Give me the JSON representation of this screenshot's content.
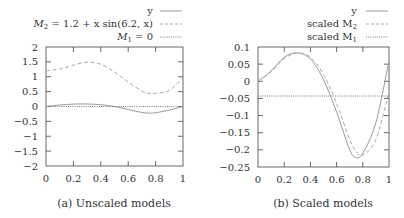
{
  "chart_data": [
    {
      "type": "line",
      "caption": "(a) Unscaled models",
      "xlabel": "",
      "ylabel": "",
      "xlim": [
        0,
        1
      ],
      "ylim": [
        -2,
        2
      ],
      "xticks": [
        "0",
        "0.2",
        "0.4",
        "0.6",
        "0.8",
        "1"
      ],
      "yticks": [
        "2",
        "1.5",
        "1",
        "0.5",
        "0",
        "−0.5",
        "−1",
        "−1.5",
        "−2"
      ],
      "grid": false,
      "legend_position": "top-right, above plot",
      "x": [
        0,
        0.1,
        0.2,
        0.3,
        0.4,
        0.5,
        0.6,
        0.7,
        0.75,
        0.8,
        0.9,
        1.0
      ],
      "series": [
        {
          "name": "y",
          "style": "solid",
          "color": "#999999",
          "values": [
            0,
            0.05,
            0.08,
            0.085,
            0.06,
            0.0,
            -0.1,
            -0.2,
            -0.22,
            -0.21,
            -0.12,
            0.0
          ]
        },
        {
          "name": "M_2 = 1.2 + x sin(6.2, x)",
          "style": "dashed",
          "color": "#aaaaaa",
          "values": [
            1.2,
            1.26,
            1.39,
            1.49,
            1.42,
            1.16,
            0.82,
            0.52,
            0.44,
            0.44,
            0.54,
            0.97
          ]
        },
        {
          "name": "M_1 = 0",
          "style": "dotted",
          "color": "#777777",
          "values": [
            0,
            0,
            0,
            0,
            0,
            0,
            0,
            0,
            0,
            0,
            0,
            0
          ]
        }
      ]
    },
    {
      "type": "line",
      "caption": "(b) Scaled models",
      "xlabel": "",
      "ylabel": "",
      "xlim": [
        0,
        1
      ],
      "ylim": [
        -0.25,
        0.1
      ],
      "xticks": [
        "0",
        "0.2",
        "0.4",
        "0.6",
        "0.8",
        "1"
      ],
      "yticks": [
        "0.1",
        "0.05",
        "0",
        "−0.05",
        "−0.1",
        "−0.15",
        "−0.2",
        "−0.25"
      ],
      "grid": false,
      "legend_position": "top-right, above plot",
      "x": [
        0,
        0.1,
        0.2,
        0.3,
        0.4,
        0.5,
        0.6,
        0.7,
        0.75,
        0.8,
        0.9,
        1.0
      ],
      "series": [
        {
          "name": "y",
          "style": "solid",
          "color": "#999999",
          "values": [
            0.0,
            0.03,
            0.07,
            0.083,
            0.065,
            0.005,
            -0.09,
            -0.2,
            -0.222,
            -0.21,
            -0.12,
            0.06
          ]
        },
        {
          "name": "scaled M_2",
          "style": "dashed",
          "color": "#aaaaaa",
          "values": [
            0.0,
            0.028,
            0.066,
            0.082,
            0.07,
            0.02,
            -0.065,
            -0.17,
            -0.205,
            -0.215,
            -0.17,
            -0.03
          ]
        },
        {
          "name": "scaled M_1",
          "style": "dotted",
          "color": "#777777",
          "values": [
            -0.043,
            -0.043,
            -0.043,
            -0.043,
            -0.043,
            -0.043,
            -0.043,
            -0.043,
            -0.043,
            -0.043,
            -0.043,
            -0.043
          ]
        }
      ]
    }
  ],
  "legend_a": {
    "y": "y",
    "m2_prefix": "M",
    "m2_sub": "2",
    "m2_rest": " = 1.2 + x sin(6.2, x)",
    "m1_prefix": "M",
    "m1_sub": "1",
    "m1_rest": " = 0"
  },
  "legend_b": {
    "y": "y",
    "m2_prefix": "scaled M",
    "m2_sub": "2",
    "m1_prefix": "scaled M",
    "m1_sub": "1"
  },
  "captions": {
    "a": "(a) Unscaled models",
    "b": "(b) Scaled models"
  }
}
